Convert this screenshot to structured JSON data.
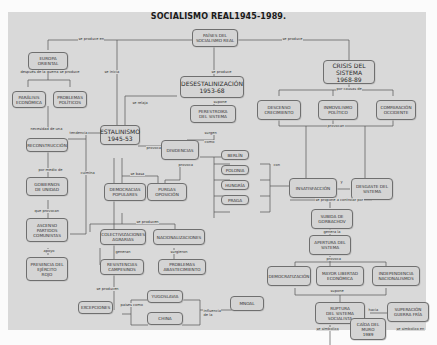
{
  "title": "SOCIALISMO REAL1945-1989.",
  "nodes": {
    "paises": "PAÍSES DEL\nSOCIALISMO REAL",
    "europa": "EUROPA\nORIENTAL",
    "paralisis": "PARÁLISIS\nECONÓMICA",
    "problemas_pol": "PROBLEMAS\nPOLÍTICOS",
    "reconstruccion": "RECONSTRUCCIÓN",
    "gobiernos": "GOBIERNOS\nDE UNIDAD",
    "ascenso": "ASCENSO\nPARTIDOS\nCOMUNISTAS",
    "presencia": "PRESENCIA DEL\nEJÉRCITO\nROJO",
    "desestalinizacion": "DESESTALINIZACIÓN\n1953-68",
    "perestroika": "PERESTROIKA\nDEL SISTEMA",
    "estalinismo": "ESTALINISMO\n1945-53",
    "disidencias": "DISIDENCIAS",
    "berlin": "BERLÍN",
    "polonia": "POLONIA",
    "hungria": "HUNGRÍA",
    "praga": "PRAGA",
    "democracias": "DEMOCRACIAS\nPOPULARES",
    "purgas": "PURGAS\nOPOSICIÓN",
    "colectivizaciones": "COLECTIVIZACIONES\nAGRARIAS",
    "nacionalizaciones": "NACIONALIZACIONES",
    "resistencias": "RESISTENCIAS\nCAMPESINOS",
    "problemas_abast": "PROBLEMAS\nABASTECIMIENTO",
    "excepciones": "EXCEPCIONES",
    "yugoslavia": "YUGOSLAVIA",
    "china": "CHINA",
    "mnoal": "MNOAL",
    "crisis": "CRISIS DEL\nSISTEMA\n1968-89",
    "descenso": "DESCENSO\nCRECIMIENTO",
    "inmovilismo": "INMOVILISMO\nPOLÍTICO",
    "comparacion": "COMPARACIÓN\nOCCIDENTE",
    "insatisfaccion": "INSATISFACCIÓN",
    "desgaste": "DESGASTE DEL\nSISTEMA",
    "subida": "SUBIDA DE\nGORBACHOV",
    "apertura": "APERTURA DEL\nSISTEMA",
    "democratizacion": "DEMOCRATIZACIÓN",
    "mayor_libertad": "MAYOR LIBERTAD\nECONÓMICA",
    "independencia": "INDEPENDENCIA\nNACIONALISMOS",
    "ruptura": "RUPTURA\nDEL SISTEMA\nSOCIALISTA",
    "superacion": "SUPERACIÓN\nGUERRA FRÍA",
    "caida": "CAÍDA DEL\nMURO\n1989"
  },
  "links": {
    "se_produce_en": "se produce en",
    "se_produce": "se produce",
    "despues_guerra": "después de la guerra se produce",
    "se_inicia": "se inicia",
    "se_produce_2": "se produce",
    "supone": "supone",
    "se_relaja": "se relaja",
    "necesidad": "necesidad de una",
    "tendencia": "tendencia",
    "por_medio": "por medio de",
    "culmina": "culmina",
    "que_provocan": "que provocan",
    "apoya": "apoyo",
    "provoca": "provoca",
    "surgen": "surgen",
    "como": "como",
    "provoca_2": "provoca",
    "se_basa": "se basa",
    "se_producen": "se producen",
    "generan": "generan",
    "surgieron": "surgieron",
    "se_producen_2": "se producen",
    "paises_como": "países como",
    "influencia": "influencia\nde la",
    "por_causas": "por causas de",
    "provocan": "provocan",
    "con": "con",
    "y": "y",
    "se_propone": "se propone a controlar por",
    "genera": "genera la",
    "provoca_3": "provoca",
    "supone_2": "supone",
    "hacia": "hacia",
    "se_simboliza": "se simboliza",
    "se_simboliza_2": "se simboliza en"
  }
}
